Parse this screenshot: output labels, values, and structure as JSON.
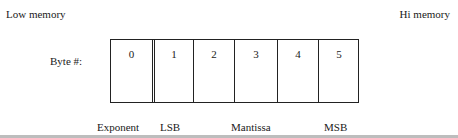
{
  "labels": {
    "low_memory": "Low memory",
    "hi_memory": "Hi memory",
    "byte_label": "Byte #:"
  },
  "bytes": [
    "0",
    "1",
    "2",
    "3",
    "4",
    "5"
  ],
  "captions": {
    "exponent": "Exponent",
    "lsb": "LSB",
    "mantissa": "Mantissa",
    "msb": "MSB"
  }
}
